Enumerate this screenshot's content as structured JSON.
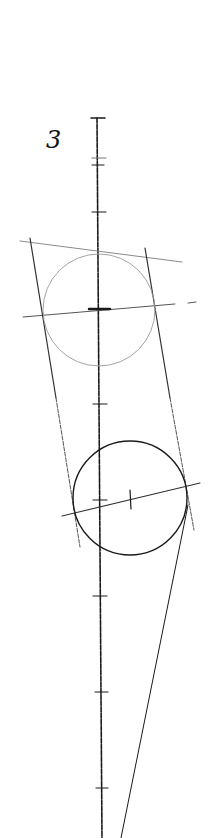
{
  "figure": {
    "label": "3"
  },
  "colors": {
    "paper": "#ffffff",
    "pencil_dark": "#1a1a1a",
    "pencil_light": "#8a8a8a"
  }
}
